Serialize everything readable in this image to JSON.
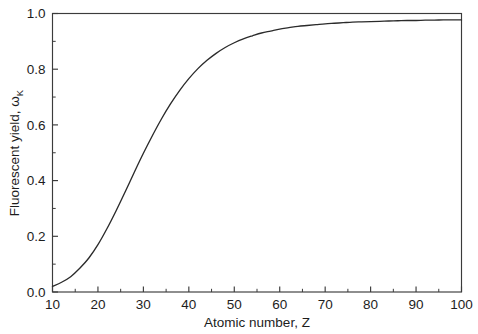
{
  "chart_data": {
    "type": "line",
    "title": "",
    "xlabel": "Atomic number, Z",
    "ylabel_main": "Fluorescent yield, ω",
    "ylabel_sub": "K",
    "xlim": [
      10,
      100
    ],
    "ylim": [
      0.0,
      1.0
    ],
    "grid": false,
    "legend": "none",
    "xticks": [
      10,
      20,
      30,
      40,
      50,
      60,
      70,
      80,
      90,
      100
    ],
    "xtick_labels": [
      "10",
      "20",
      "30",
      "40",
      "50",
      "60",
      "70",
      "80",
      "90",
      "100"
    ],
    "xminor_ticks": [
      15,
      25,
      35,
      45,
      55,
      65,
      75,
      85,
      95
    ],
    "yticks": [
      0.0,
      0.2,
      0.4,
      0.6,
      0.8,
      1.0
    ],
    "ytick_labels": [
      "0.0",
      "0.2",
      "0.4",
      "0.6",
      "0.8",
      "1.0"
    ],
    "yminor_ticks": [
      0.1,
      0.3,
      0.5,
      0.7,
      0.9
    ],
    "series": [
      {
        "name": "K-shell fluorescence yield",
        "color": "#2b2b2b",
        "x": [
          10,
          12,
          14,
          16,
          18,
          20,
          22,
          24,
          26,
          28,
          30,
          32,
          34,
          36,
          38,
          40,
          42,
          44,
          46,
          48,
          50,
          52,
          54,
          56,
          58,
          60,
          62,
          64,
          66,
          68,
          70,
          72,
          74,
          76,
          78,
          80,
          82,
          84,
          86,
          88,
          90,
          92,
          94,
          96,
          98,
          100
        ],
        "y": [
          0.02,
          0.035,
          0.055,
          0.085,
          0.122,
          0.17,
          0.228,
          0.292,
          0.36,
          0.43,
          0.498,
          0.562,
          0.622,
          0.676,
          0.724,
          0.766,
          0.802,
          0.832,
          0.857,
          0.878,
          0.895,
          0.909,
          0.92,
          0.93,
          0.937,
          0.944,
          0.949,
          0.954,
          0.957,
          0.96,
          0.963,
          0.965,
          0.967,
          0.969,
          0.97,
          0.971,
          0.972,
          0.973,
          0.974,
          0.975,
          0.975,
          0.976,
          0.976,
          0.977,
          0.977,
          0.977
        ]
      }
    ]
  },
  "axes": {
    "x_title": "Atomic number, Z",
    "y_title_main": "Fluorescent yield, ω",
    "y_title_sub": "K"
  }
}
